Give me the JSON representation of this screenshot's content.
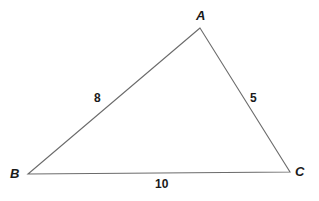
{
  "figure": {
    "type": "triangle-diagram",
    "background_color": "#ffffff",
    "stroke_color": "#6b6b6b",
    "text_color": "#1a1a1a",
    "vertices": [
      {
        "id": "A",
        "label": "A",
        "x": 200,
        "y": 28
      },
      {
        "id": "B",
        "label": "B",
        "x": 28,
        "y": 174
      },
      {
        "id": "C",
        "label": "C",
        "x": 290,
        "y": 172
      }
    ],
    "sides": [
      {
        "id": "AB",
        "from": "A",
        "to": "B",
        "length_label": "8"
      },
      {
        "id": "AC",
        "from": "A",
        "to": "C",
        "length_label": "5"
      },
      {
        "id": "BC",
        "from": "B",
        "to": "C",
        "length_label": "10"
      }
    ]
  },
  "chart_data": {
    "type": "diagram",
    "title": "",
    "shape": "triangle",
    "vertex_labels": [
      "A",
      "B",
      "C"
    ],
    "side_labels": [
      "8",
      "5",
      "10"
    ],
    "side_values": {
      "AB": 8,
      "AC": 5,
      "BC": 10
    },
    "vertex_coords": {
      "A": [
        200,
        28
      ],
      "B": [
        28,
        174
      ],
      "C": [
        290,
        172
      ]
    },
    "xlabel": "",
    "ylabel": "",
    "grid": false,
    "legend": "none"
  }
}
